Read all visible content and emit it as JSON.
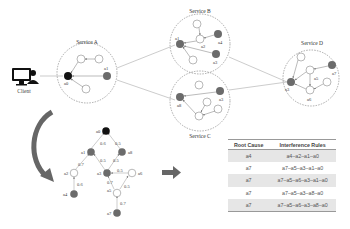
{
  "topology": {
    "client_label": "Client",
    "services": [
      {
        "name": "Service A",
        "nodes": [
          "a0",
          "a1"
        ]
      },
      {
        "name": "Service B",
        "nodes": [
          "a1",
          "a2",
          "a3",
          "a4"
        ]
      },
      {
        "name": "Service C",
        "nodes": [
          "a3",
          "a8"
        ]
      },
      {
        "name": "Service D",
        "nodes": [
          "a5",
          "a6",
          "a7"
        ]
      }
    ],
    "node_labels": {
      "a0": "a0",
      "a1": "a1",
      "a2": "a2",
      "a3": "a3",
      "a4": "a4",
      "a5": "a5",
      "a6": "a6",
      "a7": "a7",
      "a8": "a8",
      "svcA_a1": "a1",
      "svcB_a1": "a1",
      "svcB_a2": "a2",
      "svcB_a3": "a3",
      "svcB_a4": "a4",
      "svcC_a3": "a3",
      "svcC_a8": "a8",
      "svcD_a5": "a5",
      "svcD_a6": "a6",
      "svcD_a7": "a7",
      "svcD_a3": "a3"
    }
  },
  "graph": {
    "nodes": [
      "a0",
      "a1",
      "a8",
      "a2",
      "a3",
      "a6",
      "a4",
      "a5",
      "a7"
    ],
    "edges": [
      {
        "from": "a1",
        "to": "a0",
        "weight": "0.6"
      },
      {
        "from": "a8",
        "to": "a0",
        "weight": "0.5"
      },
      {
        "from": "a2",
        "to": "a1",
        "weight": "0.7"
      },
      {
        "from": "a3",
        "to": "a1",
        "weight": "0.5"
      },
      {
        "from": "a3",
        "to": "a8",
        "weight": "0.5"
      },
      {
        "from": "a6",
        "to": "a3",
        "weight": "0.5"
      },
      {
        "from": "a4",
        "to": "a2",
        "weight": "0.6"
      },
      {
        "from": "a5",
        "to": "a3",
        "weight": "0.7"
      },
      {
        "from": "a5",
        "to": "a6",
        "weight": "0.5"
      },
      {
        "from": "a7",
        "to": "a5",
        "weight": "0.7"
      }
    ]
  },
  "table": {
    "headers": [
      "Root Cause",
      "Interference Rules"
    ],
    "rows": [
      {
        "root_cause": "a4",
        "rule": "a4–a2–a1–a0"
      },
      {
        "root_cause": "a7",
        "rule": "a7–a5–a3–a1–a0"
      },
      {
        "root_cause": "a7",
        "rule": "a7–a5–a6–a3–a1–a0"
      },
      {
        "root_cause": "a7",
        "rule": "a7–a5–a3–a8–a0"
      },
      {
        "root_cause": "a7",
        "rule": "a7–a5–a6–a3–a8–a0"
      }
    ]
  },
  "colors": {
    "dark_node": "#111111",
    "gray_node": "#6b6b6b",
    "outline": "#888888",
    "shade": "#e6e6e6",
    "arrow": "#6f6f6f"
  }
}
